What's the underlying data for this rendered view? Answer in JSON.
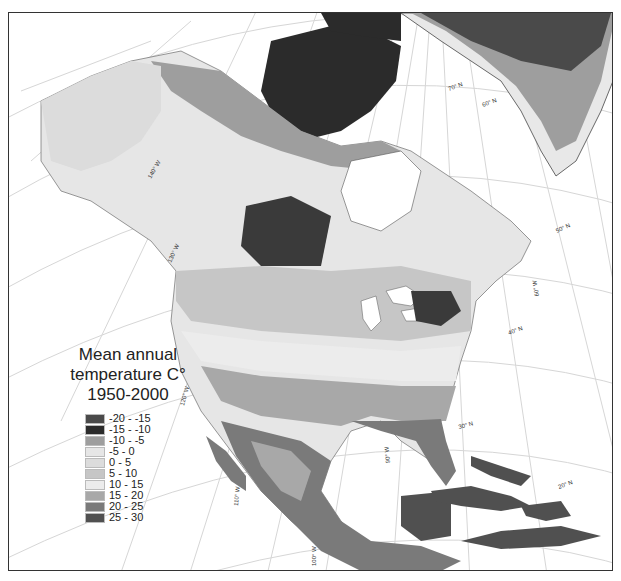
{
  "legend": {
    "title_line1": "Mean annual",
    "title_line2": "temperature C°",
    "title_line3": "1950-2000",
    "items": [
      {
        "label": "-20 - -15",
        "color": "#4a4a4a"
      },
      {
        "label": "-15 - -10",
        "color": "#2b2b2b"
      },
      {
        "label": "-10 - -5",
        "color": "#9e9e9e"
      },
      {
        "label": "-5 - 0",
        "color": "#e6e6e6"
      },
      {
        "label": "0 - 5",
        "color": "#dcdcdc"
      },
      {
        "label": "5 - 10",
        "color": "#c6c6c6"
      },
      {
        "label": "10 - 15",
        "color": "#ececec"
      },
      {
        "label": "15 - 20",
        "color": "#a8a8a8"
      },
      {
        "label": "20 - 25",
        "color": "#7a7a7a"
      },
      {
        "label": "25 - 30",
        "color": "#505050"
      }
    ]
  },
  "graticule": {
    "latitudes": [
      "70° N",
      "60° N",
      "50° N",
      "40° N",
      "30° N",
      "20° N"
    ],
    "longitudes": [
      "140° W",
      "130° W",
      "120° W",
      "110° W",
      "100° W",
      "90° W",
      "80° W",
      "60° W"
    ]
  },
  "labels": {
    "lat70": "70° N",
    "lat60": "60° N",
    "lat50": "50° N",
    "lat40": "40° N",
    "lat30": "30° N",
    "lat20": "20° N",
    "lon140": "140° W",
    "lon130": "130° W",
    "lon120": "120° W",
    "lon110": "110° W",
    "lon100": "100° W",
    "lon90": "90° W",
    "lon80": "80° W",
    "lon60": "60° W"
  }
}
